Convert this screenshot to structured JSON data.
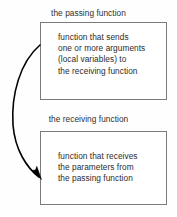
{
  "diagram": {
    "background_color": "#fefefe",
    "border_color": "#7b7b7b",
    "text_color": "#2b2b2b",
    "arrow_color": "#000000",
    "captions": {
      "passing": "the passing function",
      "receiving": "the receiving function"
    },
    "boxes": [
      {
        "id": "passing",
        "caption": "the passing function",
        "lines": [
          "function that sends",
          "one or more arguments",
          "(local variables) to",
          "the receiving function"
        ]
      },
      {
        "id": "receiving",
        "caption": "the receiving function",
        "lines": [
          "function that receives",
          "the parameters from",
          "the passing function"
        ]
      }
    ],
    "arrow": {
      "name": "curved-arrow",
      "from": "passing function box",
      "to": "receiving function box",
      "direction": "downward-curving-left"
    }
  }
}
